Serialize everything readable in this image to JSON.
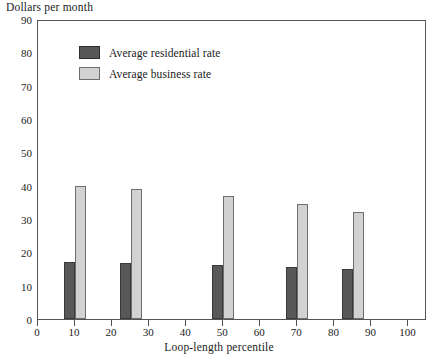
{
  "chart_data": {
    "type": "bar",
    "title": "Dollars per month",
    "xlabel": "Loop-length percentile",
    "ylabel": "Dollars per month",
    "xlim": [
      0,
      105
    ],
    "ylim": [
      0,
      90
    ],
    "grid": false,
    "legend_position": "top-left-inside",
    "x": [
      10,
      25,
      50,
      70,
      85
    ],
    "categories": [
      "10",
      "25",
      "50",
      "70",
      "85"
    ],
    "xticks": [
      0,
      10,
      20,
      30,
      40,
      50,
      60,
      70,
      80,
      90,
      100
    ],
    "xtick_labels": [
      "0",
      "10",
      "20",
      "30",
      "40",
      "50",
      "60",
      "70",
      "80",
      "90",
      "100"
    ],
    "yticks": [
      0,
      10,
      20,
      30,
      40,
      50,
      60,
      70,
      80,
      90
    ],
    "ytick_labels": [
      "0",
      "10",
      "20",
      "30",
      "40",
      "50",
      "60",
      "70",
      "80",
      "90"
    ],
    "series": [
      {
        "name": "Average residential rate",
        "color": "#585858",
        "values": [
          17.0,
          16.8,
          16.2,
          15.6,
          15.0
        ]
      },
      {
        "name": "Average business rate",
        "color": "#d2d2d2",
        "values": [
          40.0,
          39.0,
          37.0,
          34.5,
          32.0
        ]
      }
    ]
  },
  "legend": {
    "items": [
      {
        "label": "Average residential rate",
        "swatch": "residential"
      },
      {
        "label": "Average business rate",
        "swatch": "business"
      }
    ]
  }
}
